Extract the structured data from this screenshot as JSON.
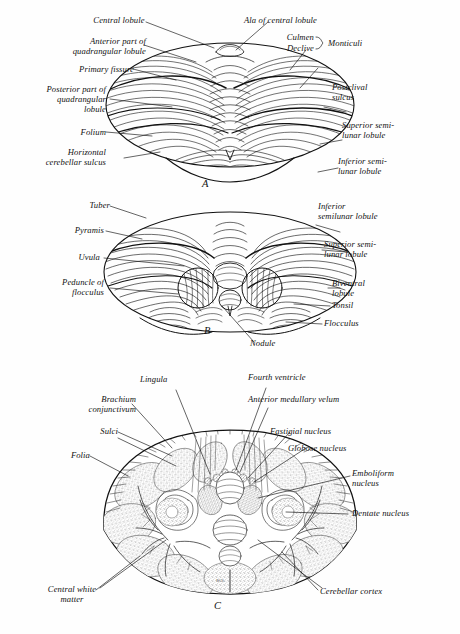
{
  "plate": {
    "title": "Cerebellum — three views",
    "background_color": "#fefefe",
    "ink_color": "#111111",
    "panel_letters": [
      "A",
      "B",
      "C"
    ],
    "artist_signature": "W.S.",
    "caption_fragment": ""
  },
  "panel_a": {
    "letter": "A",
    "view": "superior surface of cerebellum",
    "labels_left": [
      {
        "text": "Central lobule"
      },
      {
        "text": "Anterior part of\nquadrangular lobule"
      },
      {
        "text": "Primary fissure"
      },
      {
        "text": "Posterior part of\nquadrangular\nlobule"
      },
      {
        "text": "Folium"
      },
      {
        "text": "Horizontal\ncerebellar sulcus"
      }
    ],
    "labels_right": [
      {
        "text": "Ala of central lobule"
      },
      {
        "text": "Culmen"
      },
      {
        "text": "Declive"
      },
      {
        "text": "Monticuli"
      },
      {
        "text": "Postclival\nsulcus"
      },
      {
        "text": "Superior semi-\nlunar lobule"
      },
      {
        "text": "Inferior semi-\nlunar lobule"
      }
    ],
    "brace_group": "Monticuli"
  },
  "panel_b": {
    "letter": "B",
    "view": "inferior surface of cerebellum",
    "labels_left": [
      {
        "text": "Tuber"
      },
      {
        "text": "Pyramis"
      },
      {
        "text": "Uvula"
      },
      {
        "text": "Peduncle of\nflocculus"
      }
    ],
    "labels_right": [
      {
        "text": "Inferior\nsemilunar lobule"
      },
      {
        "text": "Superior semi-\nlunar lobule"
      },
      {
        "text": "Biventral\nlobule"
      },
      {
        "text": "Tonsil"
      },
      {
        "text": "Flocculus"
      }
    ],
    "labels_bottom": [
      {
        "text": "Nodule"
      }
    ]
  },
  "panel_c": {
    "letter": "C",
    "view": "horizontal section through cerebellum",
    "labels_left": [
      {
        "text": "Brachium\nconjunctivum"
      },
      {
        "text": "Sulci"
      },
      {
        "text": "Folia"
      },
      {
        "text": "Central white\nmatter"
      }
    ],
    "labels_top": [
      {
        "text": "Lingula"
      },
      {
        "text": "Fourth ventricle"
      },
      {
        "text": "Anterior medullary velum"
      }
    ],
    "labels_right": [
      {
        "text": "Fastigial nucleus"
      },
      {
        "text": "Globose nucleus"
      },
      {
        "text": "Emboliform\nnucleus"
      },
      {
        "text": "Dentate nucleus"
      },
      {
        "text": "Cerebellar cortex"
      }
    ],
    "signature": "W.S."
  }
}
